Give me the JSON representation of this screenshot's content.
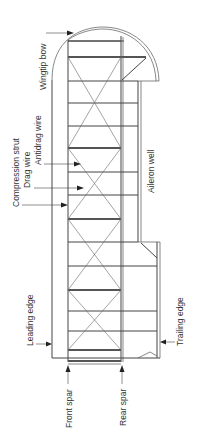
{
  "diagram": {
    "labels": {
      "wingtip_bow": "Wingtip bow",
      "compression_strut": "Compression strut",
      "drag_wire": "Drag wire",
      "antidrag_wire": "Antidrag wire",
      "aileron_well": "Aileron well",
      "leading_edge": "Leading edge",
      "trailing_edge": "Trailing edge",
      "front_spar": "Front spar",
      "rear_spar": "Rear spar"
    },
    "colors": {
      "line": "#555555",
      "text": "#333333",
      "background": "#ffffff"
    }
  }
}
